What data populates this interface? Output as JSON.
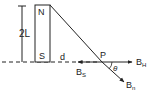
{
  "diagram": {
    "type": "physics-bar-magnet-field",
    "colors": {
      "ink": "#222222",
      "background": "#ffffff"
    },
    "magnet": {
      "north_label": "N",
      "south_label": "S"
    },
    "dimension_label": "2L",
    "distance_label": "d",
    "point_label": "P",
    "angle_label": "θ",
    "vectors": {
      "horizontal": {
        "label": "B",
        "subscript": "H"
      },
      "south_pole": {
        "label": "B",
        "subscript": "S"
      },
      "net": {
        "label": "B",
        "subscript": "n"
      }
    }
  }
}
